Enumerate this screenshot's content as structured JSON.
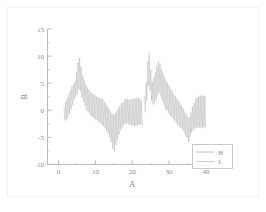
{
  "figure": {
    "background_color": "#ffffff",
    "border_color": "#f2f2f2",
    "axis_color": "#b4b4b4",
    "tick_label_color": "#8c8c8c",
    "trace_color_b": "#b9b9b9",
    "trace_color_l": "#c9c9c9"
  },
  "chart_data": {
    "type": "line",
    "title": "",
    "subtitle": "",
    "xlabel": "A",
    "ylabel": "B",
    "xlim": [
      -3,
      46
    ],
    "ylim": [
      -10,
      15
    ],
    "xticks": [
      0,
      10,
      20,
      30,
      40
    ],
    "xtick_labels": [
      "0",
      "10",
      "20",
      "30",
      "40"
    ],
    "xminor_ticks": [
      5,
      15,
      25,
      35,
      45
    ],
    "yticks": [
      -10,
      -5,
      0,
      5,
      10,
      15
    ],
    "ytick_labels": [
      "-10",
      "-5",
      "0",
      "5",
      "10",
      "15"
    ],
    "yminor_ticks": [
      -7.5,
      -2.5,
      2.5,
      7.5,
      12.5
    ],
    "grid": false,
    "legend_position": "lower right",
    "legend": [
      {
        "name": "B",
        "label": "B",
        "color": "#b9b9b9"
      },
      {
        "name": "L",
        "label": "L",
        "color": "#c9c9c9"
      }
    ],
    "series": [
      {
        "name": "B",
        "color": "#b9b9b9",
        "x_start": 1.5,
        "x_end": 40.0,
        "carrier_period": 0.42,
        "envelope_x": [
          1.5,
          2.5,
          3.5,
          4.4,
          5.1,
          5.6,
          6.5,
          7.5,
          8.5,
          9.5,
          10.5,
          11.5,
          12.5,
          13.5,
          14.4,
          15.0,
          15.8,
          16.8,
          17.8,
          18.8,
          19.6,
          20.4,
          21.2,
          22.0,
          22.6,
          22.9,
          23.2,
          23.8,
          24.2,
          24.5,
          24.9,
          25.4,
          26.0,
          26.6,
          27.2,
          27.6,
          28.2,
          29.0,
          30.0,
          31.0,
          32.0,
          33.0,
          34.0,
          34.8,
          35.3,
          35.8,
          36.5,
          37.2,
          37.8,
          38.4,
          39.2,
          40.0
        ],
        "envelope_upper": [
          0.6,
          2.6,
          4.3,
          5.2,
          8.2,
          10.2,
          6.6,
          4.5,
          3.5,
          3.0,
          2.6,
          2.3,
          1.6,
          0.6,
          -0.4,
          -0.9,
          0.0,
          1.0,
          1.9,
          2.3,
          2.0,
          2.2,
          2.3,
          2.2,
          1.6,
          1.1,
          1.6,
          5.4,
          9.2,
          11.5,
          8.2,
          5.4,
          6.3,
          7.8,
          9.2,
          8.4,
          7.2,
          5.8,
          4.6,
          3.4,
          2.4,
          1.3,
          0.2,
          -0.8,
          -1.6,
          -0.6,
          1.0,
          2.0,
          2.6,
          2.7,
          2.8,
          2.6
        ],
        "envelope_lower": [
          -2.0,
          -1.4,
          0.4,
          2.2,
          3.0,
          4.2,
          2.0,
          0.2,
          -0.8,
          -1.4,
          -1.9,
          -2.4,
          -3.1,
          -4.2,
          -6.0,
          -8.0,
          -5.8,
          -3.6,
          -2.6,
          -2.4,
          -2.7,
          -2.8,
          -2.7,
          -2.6,
          -2.7,
          -3.4,
          -2.0,
          0.8,
          3.4,
          5.2,
          3.2,
          1.1,
          1.3,
          2.2,
          3.4,
          2.9,
          1.7,
          0.4,
          -0.6,
          -1.4,
          -2.2,
          -3.0,
          -3.9,
          -4.8,
          -5.8,
          -4.8,
          -3.6,
          -3.2,
          -3.1,
          -3.2,
          -3.2,
          -3.2
        ]
      },
      {
        "name": "L",
        "color": "#c9c9c9",
        "x_start": 1.5,
        "x_end": 40.0,
        "carrier_period": 0.42,
        "envelope_x": [
          1.5,
          2.5,
          3.5,
          4.4,
          5.1,
          5.6,
          6.5,
          7.5,
          8.5,
          9.5,
          10.5,
          11.5,
          12.5,
          13.5,
          14.4,
          15.0,
          15.8,
          16.8,
          17.8,
          18.8,
          19.6,
          20.4,
          21.2,
          22.0,
          22.6,
          22.9,
          23.2,
          23.8,
          24.2,
          24.5,
          24.9,
          25.4,
          26.0,
          26.6,
          27.2,
          27.6,
          28.2,
          29.0,
          30.0,
          31.0,
          32.0,
          33.0,
          34.0,
          34.8,
          35.3,
          35.8,
          36.5,
          37.2,
          37.8,
          38.4,
          39.2,
          40.0
        ],
        "envelope_upper": [
          0.4,
          2.4,
          4.1,
          5.0,
          7.9,
          9.9,
          6.4,
          4.3,
          3.3,
          2.8,
          2.4,
          2.1,
          1.4,
          0.4,
          -0.6,
          -1.1,
          -0.2,
          0.8,
          1.7,
          2.1,
          1.8,
          2.0,
          2.1,
          2.0,
          1.4,
          0.9,
          1.4,
          5.1,
          8.9,
          11.2,
          8.0,
          5.2,
          6.1,
          7.6,
          8.9,
          8.1,
          7.0,
          5.6,
          4.4,
          3.2,
          2.2,
          1.1,
          0.0,
          -1.0,
          -1.8,
          -0.8,
          0.8,
          1.8,
          2.4,
          2.5,
          2.6,
          2.4
        ],
        "envelope_lower": [
          -2.1,
          -1.5,
          0.3,
          2.1,
          2.9,
          4.1,
          1.9,
          0.1,
          -0.9,
          -1.5,
          -2.0,
          -2.5,
          -3.2,
          -4.3,
          -6.1,
          -8.1,
          -5.9,
          -3.7,
          -2.7,
          -2.5,
          -2.8,
          -2.9,
          -2.8,
          -2.7,
          -2.8,
          -3.5,
          -2.1,
          0.6,
          3.2,
          5.0,
          3.0,
          0.9,
          1.1,
          2.0,
          3.2,
          2.7,
          1.5,
          0.2,
          -0.8,
          -1.6,
          -2.4,
          -3.2,
          -4.0,
          -4.9,
          -5.9,
          -4.9,
          -3.7,
          -3.3,
          -3.2,
          -3.3,
          -3.3,
          -3.3
        ]
      }
    ],
    "gaps": [
      [
        22.75,
        23.15
      ]
    ]
  }
}
